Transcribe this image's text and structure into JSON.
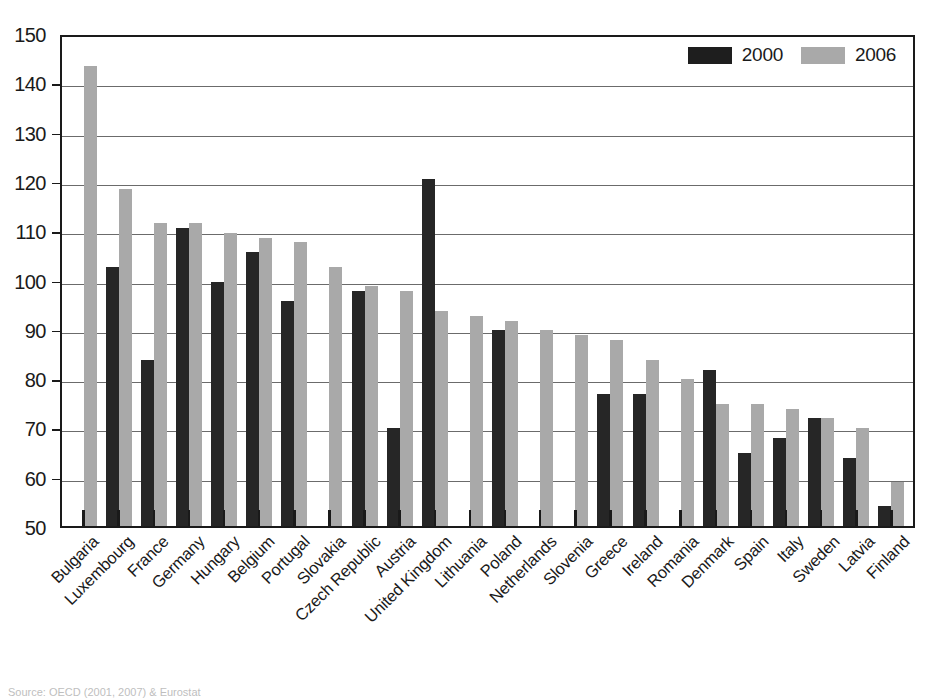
{
  "chart_data": {
    "type": "bar",
    "title": "",
    "subtitle": "",
    "xlabel": "",
    "ylabel": "",
    "ylim": [
      50,
      150
    ],
    "ytick_step": 10,
    "yticks": [
      "150",
      "140",
      "130",
      "120",
      "110",
      "100",
      "90",
      "80",
      "70",
      "60",
      "50"
    ],
    "grid": true,
    "legend_position": "top-right",
    "categories": [
      "Bulgaria",
      "Luxembourg",
      "France",
      "Germany",
      "Hungary",
      "Belgium",
      "Portugal",
      "Slovakia",
      "Czech Republic",
      "Austria",
      "United Kingdom",
      "Lithuania",
      "Poland",
      "Netherlands",
      "Slovenia",
      "Greece",
      "Ireland",
      "Romania",
      "Denmark",
      "Spain",
      "Italy",
      "Sweden",
      "Latvia",
      "Finland"
    ],
    "series": [
      {
        "name": "2000",
        "color": "#262626",
        "values": [
          null,
          103,
          84,
          111,
          100,
          106,
          96,
          null,
          98,
          70,
          121,
          null,
          90,
          null,
          null,
          77,
          77,
          null,
          82,
          65,
          68,
          72,
          64,
          54
        ]
      },
      {
        "name": "2006",
        "color": "#a9a9a9",
        "values": [
          144,
          119,
          112,
          112,
          110,
          109,
          108,
          103,
          99,
          98,
          94,
          93,
          92,
          90,
          89,
          88,
          84,
          80,
          75,
          75,
          74,
          72,
          70,
          59
        ]
      }
    ]
  },
  "legend": {
    "items": [
      {
        "label": "2000",
        "swatch": "black-swatch"
      },
      {
        "label": "2006",
        "swatch": "gray-swatch"
      }
    ]
  },
  "source": {
    "text": "Source: OECD (2001, 2007) & Eurostat"
  }
}
